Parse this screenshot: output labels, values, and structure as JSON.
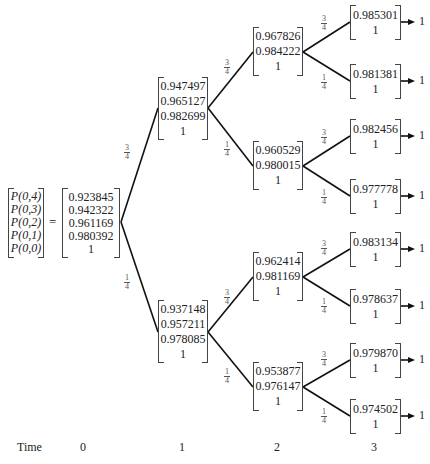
{
  "root": {
    "labels": [
      "P(0,4)",
      "P(0,3)",
      "P(0,2)",
      "P(0,1)",
      "P(0,0)"
    ],
    "equals": "=",
    "values": [
      "0.923845",
      "0.942322",
      "0.961169",
      "0.980392",
      "1"
    ]
  },
  "t1": {
    "up": [
      "0.947497",
      "0.965127",
      "0.982699",
      "1"
    ],
    "down": [
      "0.937148",
      "0.957211",
      "0.978085",
      "1"
    ]
  },
  "t2": {
    "uu": [
      "0.967826",
      "0.984222",
      "1"
    ],
    "ud": [
      "0.960529",
      "0.980015",
      "1"
    ],
    "du": [
      "0.962414",
      "0.981169",
      "1"
    ],
    "dd": [
      "0.953877",
      "0.976147",
      "1"
    ]
  },
  "t3": {
    "uuu": [
      "0.985301",
      "1"
    ],
    "uud": [
      "0.981381",
      "1"
    ],
    "udu": [
      "0.982456",
      "1"
    ],
    "udd": [
      "0.977778",
      "1"
    ],
    "duu": [
      "0.983134",
      "1"
    ],
    "dud": [
      "0.978637",
      "1"
    ],
    "ddu": [
      "0.979870",
      "1"
    ],
    "ddd": [
      "0.974502",
      "1"
    ]
  },
  "terminal_value": "1",
  "probabilities": {
    "up": {
      "num": "3",
      "den": "4"
    },
    "down": {
      "num": "1",
      "den": "4"
    }
  },
  "time_axis": {
    "label": "Time",
    "ticks": [
      "0",
      "1",
      "2",
      "3"
    ]
  }
}
